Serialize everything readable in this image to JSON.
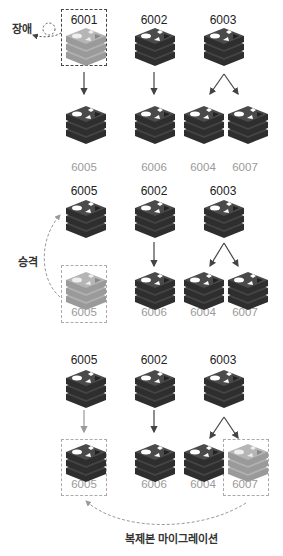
{
  "diagram": {
    "colors": {
      "node_active": "#3c3c3c",
      "node_failed": "#a8a8a8",
      "label_top": "#222222",
      "label_bottom": "#9a9a9a",
      "arrow": "#444444",
      "dashed": "#999999"
    },
    "panels": [
      {
        "id": "panel-1",
        "masters": [
          "6001",
          "6002",
          "6003"
        ],
        "replicas": [
          "6005",
          "6006",
          "6004",
          "6007"
        ],
        "annotation": "장애",
        "failed_node": "6001"
      },
      {
        "id": "panel-2",
        "masters": [
          "6005",
          "6002",
          "6003"
        ],
        "replicas": [
          "6005",
          "6006",
          "6004",
          "6007"
        ],
        "annotation": "승격",
        "failed_node": "6005"
      },
      {
        "id": "panel-3",
        "masters": [
          "6005",
          "6002",
          "6003"
        ],
        "replicas": [
          "6005",
          "6006",
          "6004",
          "6007"
        ],
        "annotation": "복제본 마이그레이션",
        "migrated_node": "6007"
      }
    ]
  }
}
